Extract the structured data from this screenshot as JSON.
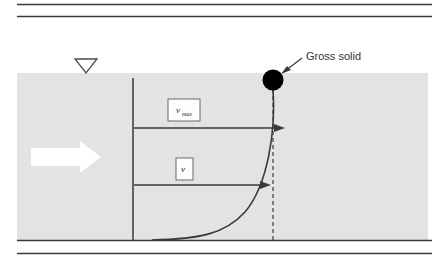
{
  "figure": {
    "background_color": "#ffffff",
    "channel_fill": "#e3e3e3",
    "line_color": "#3a3a3a",
    "solid_color": "#000000",
    "arrow_fill": "#ffffff"
  },
  "rules": {
    "top_rule_1": "horizontal-rule",
    "top_rule_2": "horizontal-rule",
    "bottom_rule": "horizontal-rule"
  },
  "labels": {
    "v_max": {
      "symbol": "v",
      "subscript": "max",
      "full": "v_max"
    },
    "v": {
      "symbol": "v",
      "subscript": "",
      "full": "v"
    },
    "gross_solid": "Gross solid"
  },
  "icons": {
    "water_level": "water-level-triangle-icon",
    "flow_arrow": "flow-direction-arrow-icon",
    "solid_particle": "gross-solid-circle-icon",
    "velocity_arrow_top": "velocity-vector-arrow-icon",
    "velocity_arrow_bottom": "velocity-vector-arrow-icon",
    "callout_leader": "callout-leader-line-icon"
  },
  "geometry": {
    "channel": {
      "x": 17,
      "y": 73,
      "width": 411,
      "height": 167
    },
    "datum_line_x": 133,
    "dashed_line_x": 273,
    "solid_center": {
      "x": 273,
      "y": 80
    },
    "solid_radius": 10,
    "top_arrow_y": 128,
    "bottom_arrow_y": 185
  }
}
